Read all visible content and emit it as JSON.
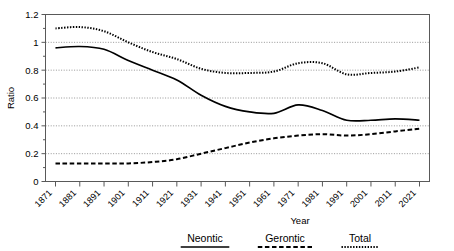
{
  "chart_data": {
    "type": "line",
    "title": "",
    "xlabel": "Year",
    "ylabel": "Ratio",
    "ylim": [
      0,
      1.2
    ],
    "ytick_labels": [
      "0",
      "0.2",
      "0.4",
      "0.6",
      "0.8",
      "1",
      "1.2"
    ],
    "ytick_values": [
      0,
      0.2,
      0.4,
      0.6,
      0.8,
      1.0,
      1.2
    ],
    "grid": "horizontal-dotted",
    "legend_position": "below-axis",
    "x": [
      1871,
      1881,
      1891,
      1901,
      1911,
      1921,
      1931,
      1941,
      1951,
      1961,
      1971,
      1981,
      1991,
      2001,
      2011,
      2021
    ],
    "categories": [
      "1871",
      "1881",
      "1891",
      "1901",
      "1911",
      "1921",
      "1931",
      "1941",
      "1951",
      "1961",
      "1971",
      "1981",
      "1991",
      "2001",
      "2011",
      "2021"
    ],
    "series": [
      {
        "name": "Neontic",
        "style": "solid",
        "values": [
          0.96,
          0.97,
          0.95,
          0.87,
          0.8,
          0.73,
          0.62,
          0.54,
          0.5,
          0.49,
          0.55,
          0.51,
          0.44,
          0.44,
          0.45,
          0.44
        ]
      },
      {
        "name": "Gerontic",
        "style": "dashed",
        "values": [
          0.13,
          0.13,
          0.13,
          0.13,
          0.14,
          0.16,
          0.2,
          0.24,
          0.28,
          0.31,
          0.33,
          0.34,
          0.33,
          0.34,
          0.36,
          0.38
        ]
      },
      {
        "name": "Total",
        "style": "dotted",
        "values": [
          1.1,
          1.11,
          1.08,
          1.0,
          0.93,
          0.88,
          0.81,
          0.78,
          0.78,
          0.79,
          0.85,
          0.85,
          0.77,
          0.78,
          0.79,
          0.82
        ]
      }
    ]
  },
  "legend": {
    "items": [
      {
        "label": "Neontic",
        "style": "solid"
      },
      {
        "label": "Gerontic",
        "style": "dashed"
      },
      {
        "label": "Total",
        "style": "dotted"
      }
    ]
  },
  "colors": {
    "line": "#000000",
    "grid": "#8a8a8a",
    "axis": "#555555",
    "background": "#ffffff"
  }
}
